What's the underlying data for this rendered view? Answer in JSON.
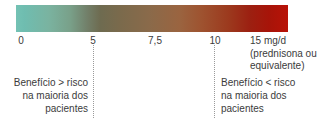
{
  "chart_data": {
    "type": "bar",
    "title": "",
    "subtitle": "",
    "xlabel": "15 mg/d (prednisona ou equivalente)",
    "ylabel": "",
    "xlim": [
      0,
      15
    ],
    "grid": false,
    "legend": "none",
    "colorbar": {
      "orientation": "horizontal",
      "stops": [
        {
          "value": 0,
          "color": "#74c2b4"
        },
        {
          "value": 5,
          "color": "#6e6b50"
        },
        {
          "value": 7.5,
          "color": "#8a6a4a"
        },
        {
          "value": 10,
          "color": "#9c3a1e"
        },
        {
          "value": 15,
          "color": "#b81207"
        }
      ]
    },
    "tick_values": [
      0,
      5,
      7.5,
      10,
      15
    ],
    "tick_labels": [
      "0",
      "5",
      "7,5",
      "10",
      "15 mg/d"
    ],
    "annotations": [
      {
        "at": 5,
        "type": "dotted-divider"
      },
      {
        "at": 10,
        "type": "dotted-divider"
      },
      {
        "range": [
          0,
          5
        ],
        "text": "Benefício > risco na maioria dos pacientes"
      },
      {
        "range": [
          10,
          15
        ],
        "text": "Benefício < risco na maioria dos pacientes"
      }
    ]
  },
  "axis": {
    "tick_0": "0",
    "tick_5": "5",
    "tick_75": "7,5",
    "tick_10": "10"
  },
  "unit_label": {
    "line1": "15 mg/d",
    "line2": "(prednisona ou",
    "line3": "equivalente)"
  },
  "annotation_left": {
    "line1": "Benefício > risco",
    "line2": "na maioria dos",
    "line3": "pacientes"
  },
  "annotation_right": {
    "line1": "Benefício < risco",
    "line2": "na maioria dos",
    "line3": "pacientes"
  },
  "colors": {
    "scale_start": "#74c2b4",
    "scale_mid": "#8a6a4a",
    "scale_end": "#b81207",
    "text": "#3b3b3b",
    "divider": "#9a9a9a",
    "background": "#ffffff"
  }
}
